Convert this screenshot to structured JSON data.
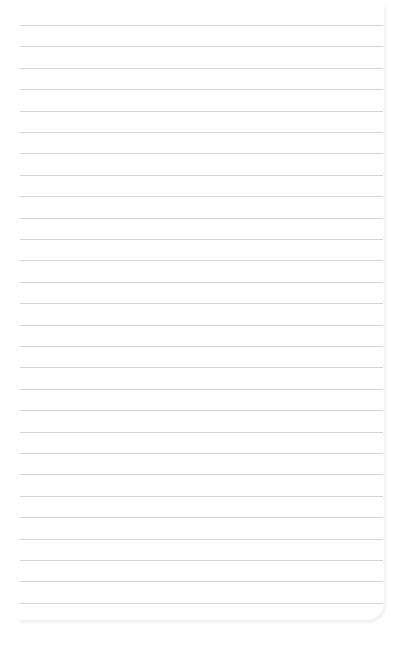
{
  "paper": {
    "type": "lined-notepad-sheet",
    "line_color": "#d4d4d4",
    "background": "#ffffff",
    "line_count": 28,
    "first_line_y": 25,
    "line_spacing": 21.4,
    "line_x_start": 20,
    "line_x_end": 383
  }
}
